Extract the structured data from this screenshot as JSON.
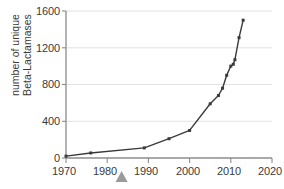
{
  "chart_data": {
    "type": "line",
    "title": "",
    "subtitle": "",
    "xlabel": "",
    "ylabel_lines": [
      "number of unique",
      "Beta-Lactamases"
    ],
    "ylabel": "number of unique Beta-Lactamases",
    "xlim": [
      1970,
      2020
    ],
    "ylim": [
      0,
      1600
    ],
    "xticks": [
      1970,
      1980,
      1990,
      2000,
      2010,
      2020
    ],
    "yticks": [
      0,
      400,
      800,
      1200,
      1600
    ],
    "xtick_labels": [
      "1970",
      "1980",
      "1990",
      "2000",
      "2010",
      "2020"
    ],
    "ytick_labels": [
      "0",
      "400",
      "800",
      "1200",
      "1600"
    ],
    "grid": "horizontal",
    "legend": "none",
    "series": [
      {
        "name": "unique Beta-Lactamases",
        "marker": "square",
        "color": "#3a3a3a",
        "x": [
          1970,
          1976,
          1989,
          1995,
          2000,
          2005,
          2007,
          2008,
          2009,
          2010,
          2010.6,
          2011,
          2012,
          2013
        ],
        "values": [
          20,
          55,
          110,
          210,
          300,
          590,
          680,
          760,
          900,
          1000,
          1020,
          1070,
          1310,
          1500
        ]
      }
    ],
    "annotations": [
      {
        "name": "triangle-marker",
        "shape": "triangle",
        "color": "#9a9a9a",
        "x": 1983.5,
        "position": "below-x-axis",
        "label": ""
      }
    ]
  },
  "colors": {
    "line": "#3a3a3a",
    "grid": "#e2e2e2",
    "axis": "#8c8c8c",
    "text": "#3a3a3a",
    "marker_annotation": "#9a9a9a",
    "background": "#ffffff"
  }
}
